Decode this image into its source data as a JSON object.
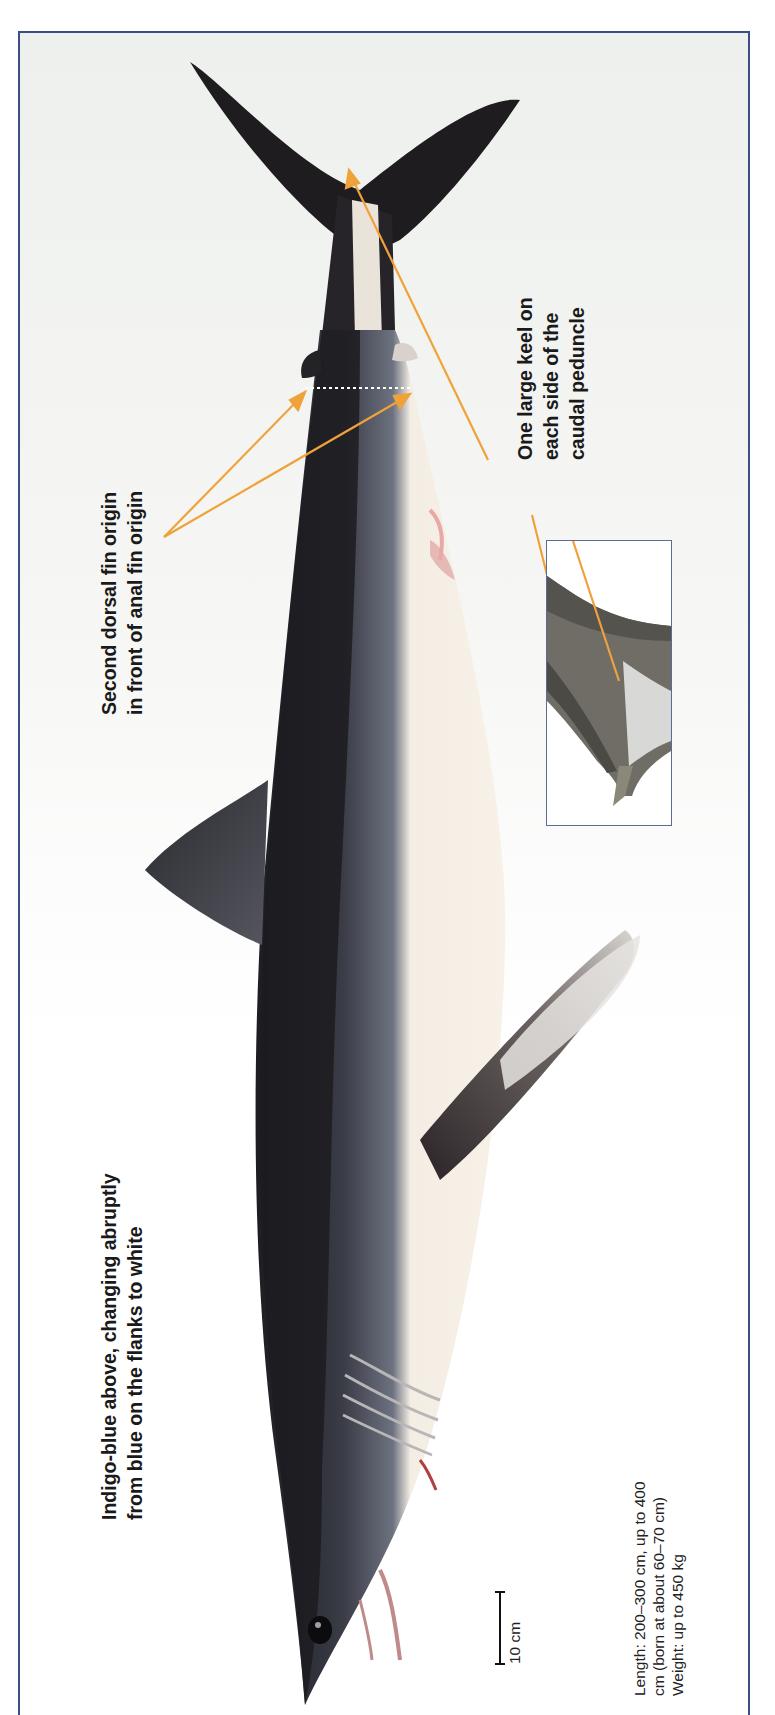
{
  "figure": {
    "frame_color": "#3b4f86",
    "arrow_color": "#f0a23a"
  },
  "annotations": {
    "coloration": {
      "line1": "Indigo-blue above, changing abruptly",
      "line2": "from blue on the flanks to white"
    },
    "dorsal_fin": {
      "line1": "Second dorsal fin origin",
      "line2": "in front of anal fin origin"
    },
    "keel": {
      "line1": "One large keel on",
      "line2": "each side of the",
      "line3": "caudal peduncle"
    }
  },
  "scale_bar": {
    "label": "10 cm"
  },
  "stats": {
    "line1": "Length: 200–300 cm, up to 400",
    "line2": "cm (born at about 60–70 cm)",
    "line3": "Weight: up to 450 kg"
  },
  "inset": {
    "description": "Close-up of caudal peduncle keel"
  }
}
